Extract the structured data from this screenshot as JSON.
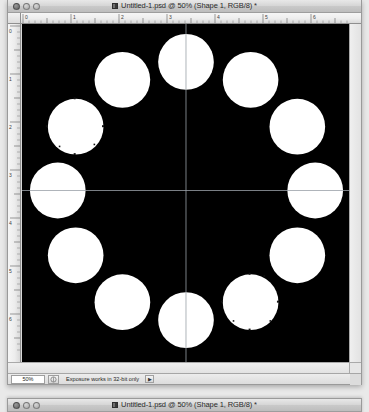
{
  "app": {
    "name": "Adobe Photoshop",
    "platform": "macOS"
  },
  "window": {
    "title": "Untitled-1.psd @ 50% (Shape 1, RGB/8) *",
    "doc_icon_name": "psd-document-icon",
    "controls": {
      "close_label": "",
      "minimize_label": "",
      "zoom_label": ""
    }
  },
  "window2": {
    "title": "Untitled-1.psd @ 50% (Shape 1, RGB/8) *"
  },
  "rulers": {
    "units": "inches",
    "horizontal_ticks": [
      "0",
      "1",
      "2",
      "3",
      "4",
      "5",
      "6"
    ],
    "vertical_ticks": [
      "0",
      "1",
      "2",
      "3",
      "4",
      "5",
      "6"
    ]
  },
  "statusbar": {
    "zoom_value": "50%",
    "grip_icon": "resize-grip-icon",
    "message": "Exposure works in 32-bit only",
    "arrow_label": "▶"
  },
  "canvas": {
    "background_color": "#000000",
    "shape_color": "#FFFFFF",
    "guide_color": "#9aa0a8",
    "guide_vertical_x_pct": 50.2,
    "guide_horizontal_y_pct": 49.0,
    "shape_layer_name": "Shape 1",
    "circle_count": 12,
    "ring_center_x_pct": 50.2,
    "ring_center_y_pct": 49.0,
    "ring_radius_pct": 38.0,
    "circle_radius_pct": 8.6,
    "circles": [
      {
        "id": "circle-12oclock",
        "angle_deg": -90,
        "selected": false
      },
      {
        "id": "circle-1oclock",
        "angle_deg": -60,
        "selected": false
      },
      {
        "id": "circle-2oclock",
        "angle_deg": -30,
        "selected": false
      },
      {
        "id": "circle-3oclock",
        "angle_deg": 0,
        "selected": false
      },
      {
        "id": "circle-4oclock",
        "angle_deg": 30,
        "selected": false
      },
      {
        "id": "circle-5oclock",
        "angle_deg": 60,
        "selected": true
      },
      {
        "id": "circle-6oclock",
        "angle_deg": 90,
        "selected": false
      },
      {
        "id": "circle-7oclock",
        "angle_deg": 120,
        "selected": false
      },
      {
        "id": "circle-8oclock",
        "angle_deg": 150,
        "selected": false
      },
      {
        "id": "circle-9oclock",
        "angle_deg": 180,
        "selected": false
      },
      {
        "id": "circle-10oclock",
        "angle_deg": 210,
        "selected": true
      },
      {
        "id": "circle-11oclock",
        "angle_deg": 240,
        "selected": false
      }
    ]
  }
}
